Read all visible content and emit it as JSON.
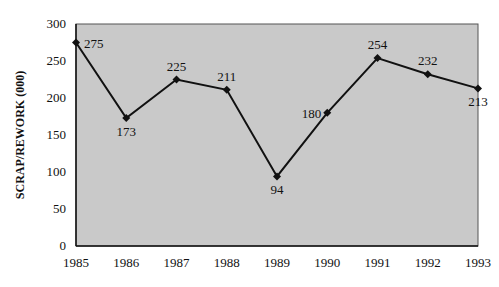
{
  "chart_data": {
    "type": "line",
    "title": "",
    "xlabel": "",
    "ylabel": "SCRAP/REWORK (000)",
    "categories": [
      "1985",
      "1986",
      "1987",
      "1988",
      "1989",
      "1990",
      "1991",
      "1992",
      "1993"
    ],
    "values": [
      275,
      173,
      225,
      211,
      94,
      180,
      254,
      232,
      213
    ],
    "data_labels": [
      "275",
      "173",
      "225",
      "211",
      "94",
      "180",
      "254",
      "232",
      "213"
    ],
    "ylim": [
      0,
      300
    ],
    "yticks": [
      0,
      50,
      100,
      150,
      200,
      250,
      300
    ],
    "ytick_labels": [
      "0",
      "50",
      "100",
      "150",
      "200",
      "250",
      "300"
    ],
    "grid": false,
    "legend": null,
    "marker": "diamond",
    "colors": {
      "line": "#111111",
      "plot_bg": "#c8c8c8"
    }
  }
}
